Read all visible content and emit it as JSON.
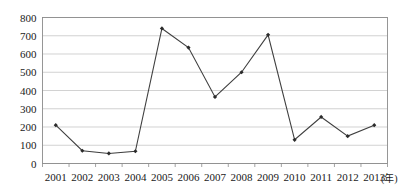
{
  "chart_data": {
    "type": "line",
    "title": "",
    "subtitle": "",
    "xlabel": "(年)",
    "ylabel": "",
    "categories": [
      "2001",
      "2002",
      "2003",
      "2004",
      "2005",
      "2006",
      "2007",
      "2008",
      "2009",
      "2010",
      "2011",
      "2012",
      "2013"
    ],
    "values": [
      210,
      70,
      55,
      67,
      740,
      635,
      365,
      500,
      705,
      130,
      255,
      150,
      210
    ],
    "series": [
      {
        "name": "",
        "values": [
          210,
          70,
          55,
          67,
          740,
          635,
          365,
          500,
          705,
          130,
          255,
          150,
          210
        ]
      }
    ],
    "ylim": [
      0,
      800
    ],
    "y_ticks": [
      0,
      100,
      200,
      300,
      400,
      500,
      600,
      700,
      800
    ],
    "y_tick_labels": [
      "0",
      "100",
      "200",
      "300",
      "400",
      "500",
      "600",
      "700",
      "800"
    ],
    "x_tick_labels": [
      "2001",
      "2002",
      "2003",
      "2004",
      "2005",
      "2006",
      "2007",
      "2008",
      "2009",
      "2010",
      "2011",
      "2012",
      "2013"
    ],
    "grid": true,
    "grid_axis": "y",
    "legend": false,
    "legend_position": "none",
    "marker": "diamond",
    "line_color": "#3f3f3f",
    "marker_color": "#2b2b2b",
    "grid_color": "#bfbfbf",
    "axis_color": "#8c8c8c",
    "background_color": "#ffffff",
    "annotations": []
  }
}
